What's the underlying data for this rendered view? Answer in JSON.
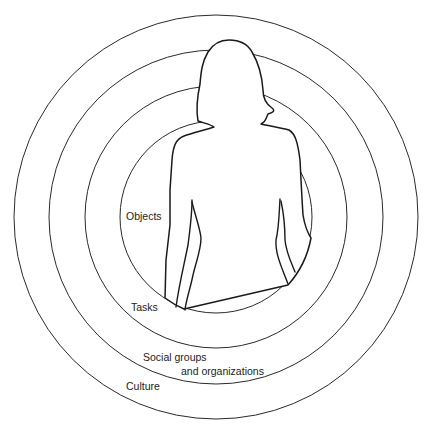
{
  "diagram": {
    "type": "concentric-context-model",
    "center_figure": "human silhouette (woman, head and torso)",
    "layers": [
      {
        "id": "objects",
        "label": "Objects",
        "order": 1
      },
      {
        "id": "tasks",
        "label": "Tasks",
        "order": 2
      },
      {
        "id": "social",
        "label_line1": "Social groups",
        "label_line2": "and organizations",
        "order": 3
      },
      {
        "id": "culture",
        "label": "Culture",
        "order": 4
      }
    ],
    "colors": {
      "background": "#ffffff",
      "stroke": "#2a2a2a",
      "text": "#222222"
    }
  }
}
